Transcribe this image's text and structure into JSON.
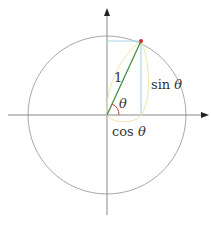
{
  "diagram": {
    "labels": {
      "hypotenuse": "1",
      "angle": "θ",
      "sin": "sin",
      "sin_theta": "θ",
      "cos": "cos",
      "cos_theta": "θ"
    },
    "geometry": {
      "center": [
        107,
        115
      ],
      "radius": 79,
      "point": [
        141,
        41
      ]
    },
    "colors": {
      "axes": "#888888",
      "circle": "#a8a8a8",
      "radius_line": "#3a8a3a",
      "projection_lines": "#a8d8ea",
      "braces": "#f0e6a8",
      "angle_arc": "#c04040",
      "point": "#d03030",
      "text": "#333333"
    }
  }
}
